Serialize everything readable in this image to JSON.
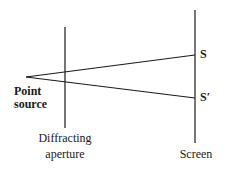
{
  "diagram": {
    "labels": {
      "point_source_line1": "Point",
      "point_source_line2": "source",
      "aperture_line1": "Diffracting",
      "aperture_line2": "aperture",
      "screen": "Screen",
      "S": "S",
      "S_prime": "S′"
    },
    "geometry": {
      "point_source": [
        26,
        77
      ],
      "aperture_x": 65,
      "aperture_y": [
        27,
        128
      ],
      "screen_x": 195,
      "screen_y": [
        10,
        143
      ],
      "S": [
        195,
        55
      ],
      "S_prime": [
        195,
        98
      ]
    },
    "colors": {
      "line": "#1a1a1a",
      "background": "#ffffff"
    }
  }
}
